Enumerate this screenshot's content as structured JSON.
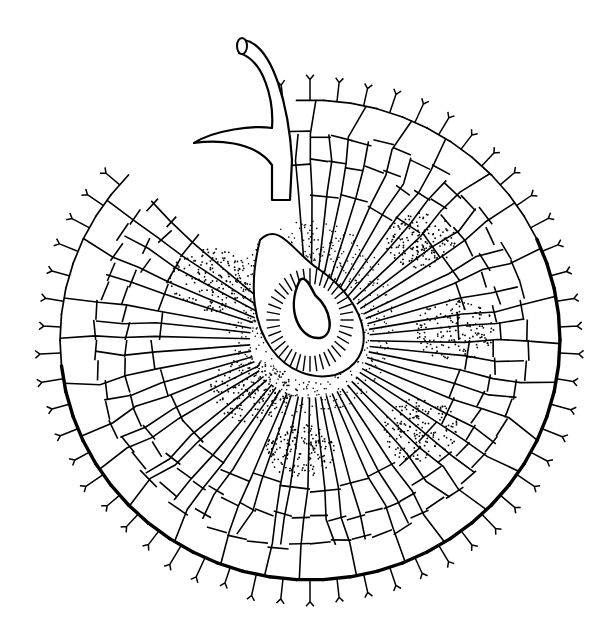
{
  "image": {
    "width": 614,
    "height": 627,
    "background": "#ffffff",
    "ink": "#000000",
    "subject": "radial cellular disc with central stalk (botanical line drawing)"
  },
  "illustration": {
    "center": [
      310,
      340
    ],
    "outer_radius_x": 250,
    "outer_radius_y": 240,
    "radial_cell_count": 64,
    "ring_count": 4,
    "marginal_hair_count": 58,
    "stalk": {
      "tip": [
        244,
        40
      ],
      "base": [
        270,
        195
      ]
    },
    "inner_pore": {
      "center": [
        310,
        300
      ],
      "rx": 38,
      "ry": 45
    },
    "stipple_bands": [
      {
        "cx": 210,
        "cy": 280,
        "r": 40
      },
      {
        "cx": 420,
        "cy": 240,
        "r": 35
      },
      {
        "cx": 455,
        "cy": 330,
        "r": 40
      },
      {
        "cx": 250,
        "cy": 390,
        "r": 40
      },
      {
        "cx": 300,
        "cy": 450,
        "r": 35
      },
      {
        "cx": 420,
        "cy": 430,
        "r": 40
      }
    ]
  }
}
